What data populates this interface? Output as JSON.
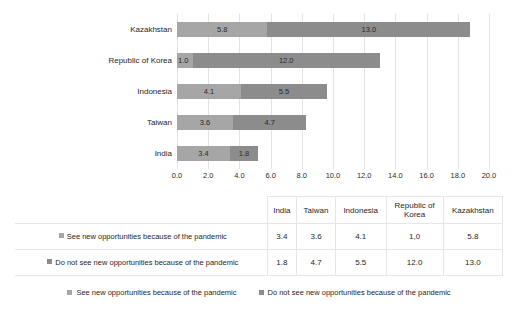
{
  "chart_data": {
    "type": "bar",
    "orientation": "horizontal",
    "stacked": true,
    "title": "",
    "xlabel": "",
    "ylabel": "",
    "xlim": [
      0.0,
      20.0
    ],
    "grid": true,
    "legend_position": "bottom",
    "categories": [
      "India",
      "Taiwan",
      "Indonesia",
      "Republic of Korea",
      "Kazakhstan"
    ],
    "categories_plot_order_top_to_bottom": [
      "Kazakhstan",
      "Republic of Korea",
      "Indonesia",
      "Taiwan",
      "India"
    ],
    "xticks": [
      "0.0",
      "2.0",
      "4.0",
      "6.0",
      "8.0",
      "10.0",
      "12.0",
      "14.0",
      "16.0",
      "18.0",
      "20.0"
    ],
    "xtick_values": [
      0,
      2,
      4,
      6,
      8,
      10,
      12,
      14,
      16,
      18,
      20
    ],
    "series": [
      {
        "name": "See new opportunities because of the pandemic",
        "color": "#a6a6a6",
        "values": [
          3.4,
          3.6,
          4.1,
          1.0,
          5.8
        ],
        "labels": [
          "3.4",
          "3.6",
          "4.1",
          "1.0",
          "5.8"
        ]
      },
      {
        "name": "Do not see new opportunities because of the pandemic",
        "color": "#8c8c8c",
        "values": [
          1.8,
          4.7,
          5.5,
          12.0,
          13.0
        ],
        "labels": [
          "1.8",
          "4.7",
          "5.5",
          "12.0",
          "13.0"
        ]
      }
    ]
  },
  "chart": {
    "bars": [
      {
        "category": "Kazakhstan",
        "segments": [
          {
            "value": 5.8,
            "label": "5.8",
            "series": "s1"
          },
          {
            "value": 13.0,
            "label": "13.0",
            "series": "s2"
          }
        ]
      },
      {
        "category": "Republic of Korea",
        "segments": [
          {
            "value": 1.0,
            "label": "1.0",
            "series": "s1"
          },
          {
            "value": 12.0,
            "label": "12.0",
            "series": "s2"
          }
        ]
      },
      {
        "category": "Indonesia",
        "segments": [
          {
            "value": 4.1,
            "label": "4.1",
            "series": "s1"
          },
          {
            "value": 5.5,
            "label": "5.5",
            "series": "s2"
          }
        ]
      },
      {
        "category": "Taiwan",
        "segments": [
          {
            "value": 3.6,
            "label": "3.6",
            "series": "s1"
          },
          {
            "value": 4.7,
            "label": "4.7",
            "series": "s2"
          }
        ]
      },
      {
        "category": "India",
        "segments": [
          {
            "value": 3.4,
            "label": "3.4",
            "series": "s1"
          },
          {
            "value": 1.8,
            "label": "1.8",
            "series": "s2"
          }
        ]
      }
    ]
  },
  "table": {
    "corner_header": "",
    "columns": [
      "India",
      "Taiwan",
      "Indonesia",
      "Republic of\nKorea",
      "Kazakhstan"
    ],
    "rows": [
      {
        "label": "See new opportunities because of the pandemic",
        "swatch": "sw1",
        "values": [
          "3.4",
          "3.6",
          "4.1",
          "1,0",
          "5.8"
        ]
      },
      {
        "label": "Do not see new opportunities because of the pandemic",
        "swatch": "sw2",
        "values": [
          "1.8",
          "4.7",
          "5.5",
          "12.0",
          "13.0"
        ]
      }
    ]
  },
  "legend": {
    "items": [
      {
        "label": "See new opportunities because of the pandemic",
        "swatch": "sw1",
        "color": "#a6a6a6"
      },
      {
        "label": "Do not see new opportunities because of the pandemic",
        "swatch": "sw2",
        "color": "#8c8c8c"
      }
    ]
  },
  "colors": {
    "series1": "#a6a6a6",
    "series2": "#8c8c8c",
    "gridline": "#e3e3e3",
    "table_border": "#e6e6e6",
    "text": "#1f1f1f",
    "background": "#ffffff"
  }
}
